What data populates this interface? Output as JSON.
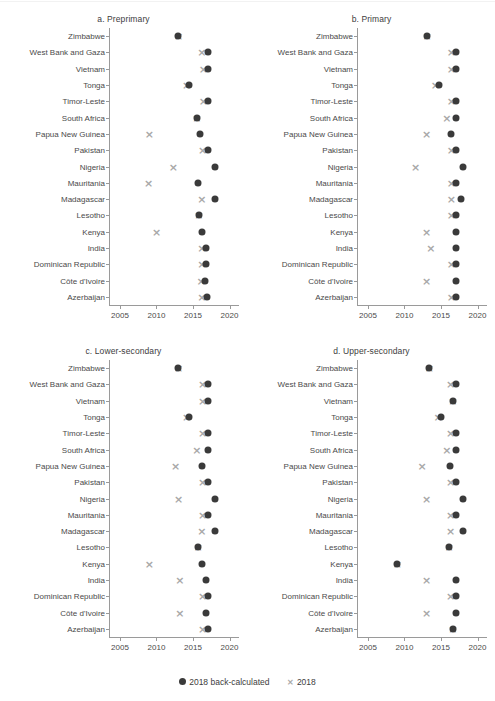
{
  "legend": {
    "items": [
      {
        "name": "back-calculated",
        "label": "2018  back-calculated",
        "marker": "circle",
        "color": "#3a3a3a",
        "symbol": "●"
      },
      {
        "name": "survey-2018",
        "label": "2018",
        "marker": "cross",
        "color": "#a8a8a8",
        "symbol": "×"
      }
    ]
  },
  "axis": {
    "xticks": [
      2005,
      2010,
      2015,
      2020
    ],
    "xticklabels": [
      "2005",
      "2010",
      "2015",
      "2020"
    ],
    "xlim": [
      2003.5,
      2021.3
    ],
    "grid": false
  },
  "countries": [
    "Zimbabwe",
    "West Bank and Gaza",
    "Vietnam",
    "Tonga",
    "Timor-Leste",
    "South Africa",
    "Papua New Guinea",
    "Pakistan",
    "Nigeria",
    "Mauritania",
    "Madagascar",
    "Lesotho",
    "Kenya",
    "India",
    "Dominican Republic",
    "Côte d'Ivoire",
    "Azerbaijan"
  ],
  "chart_data": [
    {
      "type": "scatter",
      "panel": "a",
      "title": "a. Preprimary",
      "xlabel": "",
      "ylabel": "",
      "xlim": [
        2003.5,
        2021.3
      ],
      "xticks": [
        2005,
        2010,
        2015,
        2020
      ],
      "categories": [
        "Zimbabwe",
        "West Bank and Gaza",
        "Vietnam",
        "Tonga",
        "Timor-Leste",
        "South Africa",
        "Papua New Guinea",
        "Pakistan",
        "Nigeria",
        "Mauritania",
        "Madagascar",
        "Lesotho",
        "Kenya",
        "India",
        "Dominican Republic",
        "Côte d'Ivoire",
        "Azerbaijan"
      ],
      "series": [
        {
          "name": "2018  back-calculated",
          "marker": "circle",
          "values": [
            2013.0,
            2017.0,
            2017.0,
            2014.5,
            2017.0,
            2015.5,
            2016.0,
            2017.0,
            2018.0,
            2015.7,
            2018.0,
            2015.8,
            2016.2,
            2016.8,
            2016.8,
            2016.7,
            2016.9
          ]
        },
        {
          "name": "2018",
          "marker": "cross",
          "values": [
            2013.0,
            2016.2,
            2016.4,
            2014.1,
            2016.4,
            2015.5,
            2009.0,
            2016.3,
            2012.3,
            2008.9,
            2016.2,
            2015.8,
            2010.0,
            2016.2,
            2016.2,
            2016.1,
            2016.2
          ]
        }
      ]
    },
    {
      "type": "scatter",
      "panel": "b",
      "title": "b. Primary",
      "xlabel": "",
      "ylabel": "",
      "xlim": [
        2003.5,
        2021.3
      ],
      "xticks": [
        2005,
        2010,
        2015,
        2020
      ],
      "categories": [
        "Zimbabwe",
        "West Bank and Gaza",
        "Vietnam",
        "Tonga",
        "Timor-Leste",
        "South Africa",
        "Papua New Guinea",
        "Pakistan",
        "Nigeria",
        "Mauritania",
        "Madagascar",
        "Lesotho",
        "Kenya",
        "India",
        "Dominican Republic",
        "Côte d'Ivoire",
        "Azerbaijan"
      ],
      "series": [
        {
          "name": "2018  back-calculated",
          "marker": "circle",
          "values": [
            2013.1,
            2017.0,
            2017.0,
            2014.7,
            2017.0,
            2017.0,
            2016.4,
            2017.0,
            2018.0,
            2017.0,
            2017.8,
            2017.0,
            2017.0,
            2017.0,
            2017.0,
            2017.0,
            2017.0
          ]
        },
        {
          "name": "2018",
          "marker": "cross",
          "values": [
            2013.1,
            2016.4,
            2016.4,
            2014.2,
            2016.4,
            2015.8,
            2013.0,
            2016.4,
            2011.5,
            2016.4,
            2016.4,
            2016.4,
            2013.0,
            2013.6,
            2016.4,
            2013.0,
            2016.4
          ]
        }
      ]
    },
    {
      "type": "scatter",
      "panel": "c",
      "title": "c. Lower-secondary",
      "xlabel": "",
      "ylabel": "",
      "xlim": [
        2003.5,
        2021.3
      ],
      "xticks": [
        2005,
        2010,
        2015,
        2020
      ],
      "categories": [
        "Zimbabwe",
        "West Bank and Gaza",
        "Vietnam",
        "Tonga",
        "Timor-Leste",
        "South Africa",
        "Papua New Guinea",
        "Pakistan",
        "Nigeria",
        "Mauritania",
        "Madagascar",
        "Lesotho",
        "Kenya",
        "India",
        "Dominican Republic",
        "Côte d'Ivoire",
        "Azerbaijan"
      ],
      "series": [
        {
          "name": "2018  back-calculated",
          "marker": "circle",
          "values": [
            2013.0,
            2017.0,
            2017.0,
            2014.5,
            2017.0,
            2017.0,
            2016.2,
            2017.0,
            2018.0,
            2017.0,
            2018.0,
            2015.7,
            2016.2,
            2016.8,
            2017.0,
            2016.8,
            2017.0
          ]
        },
        {
          "name": "2018",
          "marker": "cross",
          "values": [
            2013.0,
            2016.3,
            2016.3,
            2014.1,
            2016.3,
            2015.5,
            2012.6,
            2016.3,
            2013.0,
            2016.3,
            2016.2,
            2015.7,
            2009.0,
            2013.2,
            2016.3,
            2013.2,
            2016.3
          ]
        }
      ]
    },
    {
      "type": "scatter",
      "panel": "d",
      "title": "d. Upper-secondary",
      "xlabel": "",
      "ylabel": "",
      "xlim": [
        2003.5,
        2021.3
      ],
      "xticks": [
        2005,
        2010,
        2015,
        2020
      ],
      "categories": [
        "Zimbabwe",
        "West Bank and Gaza",
        "Vietnam",
        "Tonga",
        "Timor-Leste",
        "South Africa",
        "Papua New Guinea",
        "Pakistan",
        "Nigeria",
        "Mauritania",
        "Madagascar",
        "Lesotho",
        "Kenya",
        "India",
        "Dominican Republic",
        "Côte d'Ivoire",
        "Azerbaijan"
      ],
      "series": [
        {
          "name": "2018  back-calculated",
          "marker": "circle",
          "values": [
            2013.4,
            2017.0,
            2016.6,
            2015.0,
            2017.0,
            2017.0,
            2016.2,
            2017.0,
            2018.0,
            2017.0,
            2018.0,
            2016.1,
            2009.0,
            2017.0,
            2017.0,
            2017.0,
            2016.6
          ]
        },
        {
          "name": "2018",
          "marker": "cross",
          "values": [
            2013.4,
            2016.3,
            2016.6,
            2014.6,
            2016.3,
            2015.8,
            2012.4,
            2016.3,
            2013.0,
            2016.3,
            2016.3,
            2016.1,
            2009.0,
            2013.0,
            2016.3,
            2013.0,
            2016.6
          ]
        }
      ]
    }
  ]
}
